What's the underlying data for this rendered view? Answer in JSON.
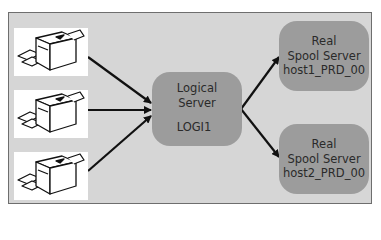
{
  "diagram": {
    "colors": {
      "frame_bg": "#d6d6d6",
      "frame_border": "#6e6e6e",
      "node_fill": "#9c9c9c",
      "arrow": "#111111",
      "printer_bg": "#ffffff"
    },
    "printers": [
      {
        "icon": "printer-icon"
      },
      {
        "icon": "printer-icon"
      },
      {
        "icon": "printer-icon"
      }
    ],
    "logical_server": {
      "line1": "Logical",
      "line2": "Server",
      "name": "LOGI1"
    },
    "real_servers": [
      {
        "line1": "Real",
        "line2": "Spool Server",
        "name": "host1_PRD_00"
      },
      {
        "line1": "Real",
        "line2": "Spool Server",
        "name": "host2_PRD_00"
      }
    ],
    "edges": [
      {
        "from": "printer-1",
        "to": "logical-server"
      },
      {
        "from": "printer-2",
        "to": "logical-server"
      },
      {
        "from": "printer-3",
        "to": "logical-server"
      },
      {
        "from": "logical-server",
        "to": "real-server-1"
      },
      {
        "from": "logical-server",
        "to": "real-server-2"
      }
    ]
  }
}
